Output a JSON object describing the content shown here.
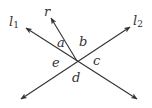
{
  "diagram": {
    "type": "intersecting-lines-angles",
    "stroke_color": "#333333",
    "intersection": {
      "x": 77,
      "y": 61
    },
    "lines": [
      {
        "id": "l1",
        "label": "l",
        "subscript": "1",
        "from": {
          "x": 21,
          "y": 99
        },
        "to": {
          "x": 137,
          "y": 99
        }
      },
      {
        "id": "l2",
        "label": "l",
        "subscript": "2"
      },
      {
        "id": "r",
        "label": "r"
      }
    ],
    "angles": {
      "a": "a",
      "b": "b",
      "c": "c",
      "d": "d",
      "e": "e"
    }
  }
}
